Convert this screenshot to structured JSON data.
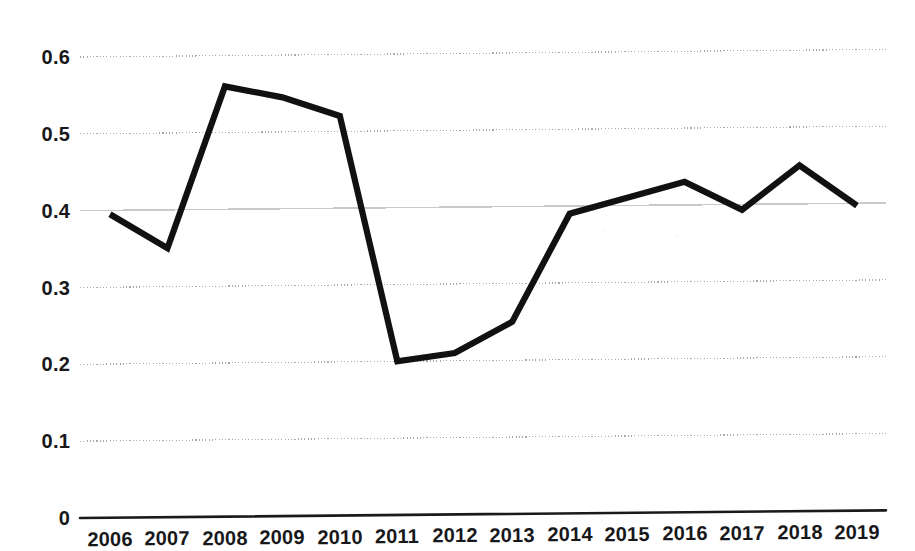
{
  "chart_data": {
    "type": "line",
    "title": "",
    "subtitle": "",
    "xlabel": "",
    "ylabel": "",
    "categories": [
      "2006",
      "2007",
      "2008",
      "2009",
      "2010",
      "2011",
      "2012",
      "2013",
      "2014",
      "2015",
      "2016",
      "2017",
      "2018",
      "2019"
    ],
    "values": [
      0.395,
      0.35,
      0.56,
      0.545,
      0.52,
      0.2,
      0.21,
      0.25,
      0.39,
      0.41,
      0.43,
      0.393,
      0.45,
      0.397
    ],
    "series": [
      {
        "name": "",
        "values": [
          0.395,
          0.35,
          0.56,
          0.545,
          0.52,
          0.2,
          0.21,
          0.25,
          0.39,
          0.41,
          0.43,
          0.393,
          0.45,
          0.397
        ]
      }
    ],
    "ylim": [
      0,
      0.63
    ],
    "xlim": [
      "2006",
      "2019"
    ],
    "y_ticks": [
      0,
      0.1,
      0.2,
      0.3,
      0.4,
      0.5,
      0.6
    ],
    "y_tick_labels": [
      "0",
      "0.1",
      "0.2",
      "0.3",
      "0.4",
      "0.5",
      "0.6"
    ],
    "x_tick_labels": [
      "2006",
      "2007",
      "2008",
      "2009",
      "2010",
      "2011",
      "2012",
      "2013",
      "2014",
      "2015",
      "2016",
      "2017",
      "2018",
      "2019"
    ],
    "grid": true,
    "grid_style": "dotted",
    "legend": "none",
    "legend_position": "none",
    "annotations": [],
    "line_color": "#111111",
    "grid_color": "#b9b9b9",
    "axis_color": "#1a1a1a",
    "background_color": "#ffffff"
  },
  "axes": {
    "y_labels": [
      "0.6",
      "0.5",
      "0.4",
      "0.3",
      "0.2",
      "0.1",
      "0"
    ],
    "x_labels": [
      "2006",
      "2007",
      "2008",
      "2009",
      "2010",
      "2011",
      "2012",
      "2013",
      "2014",
      "2015",
      "2016",
      "2017",
      "2018",
      "2019"
    ]
  }
}
